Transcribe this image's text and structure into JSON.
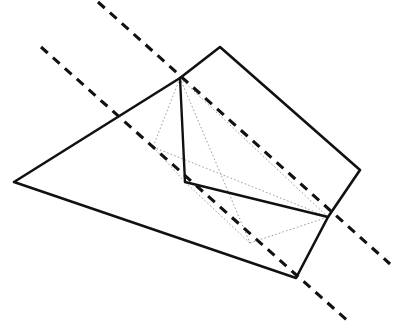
{
  "figure": {
    "canvas": {
      "width": 393,
      "height": 327,
      "background": "#ffffff"
    },
    "colors": {
      "solid_stroke": "#111111",
      "hidden_stroke": "#8c8c8c",
      "cut_line_stroke": "#111111",
      "background": "#ffffff"
    },
    "vertices": {
      "left": [
        14,
        182
      ],
      "top_peak": [
        220,
        47
      ],
      "ridge_front": [
        180,
        78
      ],
      "right": [
        360,
        170
      ],
      "right_mid": [
        328,
        217
      ],
      "bottom": [
        296,
        278
      ],
      "base_front": [
        185,
        182
      ],
      "hidden_left": [
        153,
        147
      ],
      "hidden_bottom": [
        250,
        243
      ]
    },
    "solid_edges": [
      {
        "name": "left-to-ridge-front",
        "from": [
          14,
          182
        ],
        "to": [
          180,
          78
        ]
      },
      {
        "name": "ridge-front-to-top-peak",
        "from": [
          180,
          78
        ],
        "to": [
          220,
          47
        ]
      },
      {
        "name": "top-peak-to-right",
        "from": [
          220,
          47
        ],
        "to": [
          360,
          170
        ]
      },
      {
        "name": "right-to-right-mid",
        "from": [
          360,
          170
        ],
        "to": [
          328,
          217
        ]
      },
      {
        "name": "right-mid-to-bottom",
        "from": [
          328,
          217
        ],
        "to": [
          296,
          278
        ]
      },
      {
        "name": "bottom-to-left",
        "from": [
          296,
          278
        ],
        "to": [
          14,
          182
        ]
      }
    ],
    "inner_solid_edges": [
      {
        "name": "ridge-front-to-base-front",
        "from": [
          180,
          78
        ],
        "to": [
          185,
          182
        ]
      },
      {
        "name": "base-front-to-right-mid",
        "from": [
          185,
          182
        ],
        "to": [
          328,
          217
        ]
      }
    ],
    "hidden_edges": [
      {
        "name": "ridge-front-to-hidden-left",
        "from": [
          180,
          78
        ],
        "to": [
          153,
          147
        ]
      },
      {
        "name": "hidden-left-to-base-front",
        "from": [
          153,
          147
        ],
        "to": [
          185,
          182
        ]
      },
      {
        "name": "hidden-left-to-right-mid",
        "from": [
          153,
          147
        ],
        "to": [
          328,
          217
        ]
      },
      {
        "name": "ridge-front-to-hidden-bottom",
        "from": [
          180,
          78
        ],
        "to": [
          250,
          243
        ]
      },
      {
        "name": "hidden-bottom-to-right-mid",
        "from": [
          250,
          243
        ],
        "to": [
          328,
          217
        ]
      },
      {
        "name": "hidden-bottom-to-base-front",
        "from": [
          250,
          243
        ],
        "to": [
          185,
          182
        ]
      },
      {
        "name": "ridge-front-to-right-mid",
        "from": [
          180,
          78
        ],
        "to": [
          328,
          217
        ]
      }
    ],
    "cut_lines": [
      {
        "name": "cut-line-upper",
        "from": [
          98,
          2
        ],
        "to": [
          390,
          264
        ]
      },
      {
        "name": "cut-line-lower",
        "from": [
          41,
          47
        ],
        "to": [
          349,
          322
        ]
      }
    ]
  }
}
